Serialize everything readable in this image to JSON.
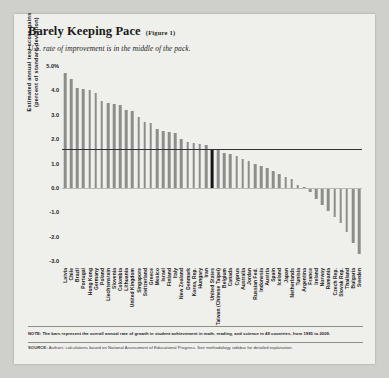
{
  "header": {
    "title": "Barely Keeping Pace",
    "figure_label": "(Figure 1)",
    "subtitle": "U.S. rate of improvement is in the middle of the pack."
  },
  "footer": {
    "note_lead": "NOTE:",
    "note_text": "The bars represent the overall annual rate of growth in student achievement in math, reading, and science in 49 countries, from 1995 to 2009.",
    "source_lead": "SOURCE:",
    "source_text": "Authors' calculations based on National Assessment of Educational Progress. See methodology sidebar for detailed explanation."
  },
  "colors": {
    "bar": "#8d8d8a",
    "highlight_bar": "#161616",
    "reference_line": "#333333",
    "page_background": "#efefec"
  },
  "chart_data": {
    "type": "bar",
    "title": "Barely Keeping Pace",
    "subtitle": "U.S. rate of improvement is in the middle of the pack.",
    "xlabel": "",
    "ylabel": "Estimated annual test-score gains (percent of standard deviation)",
    "ylim": [
      -3.0,
      5.0
    ],
    "yticks": [
      "5.0%",
      "4.0",
      "3.0",
      "2.0",
      "1.0",
      "0.0",
      "-1.0",
      "-2.0",
      "-3.0"
    ],
    "ytick_values": [
      5.0,
      4.0,
      3.0,
      2.0,
      1.0,
      0.0,
      -1.0,
      -2.0,
      -3.0
    ],
    "grid": false,
    "legend": "none",
    "highlight_category": "United States",
    "reference_line": {
      "value": 1.6,
      "label": ""
    },
    "categories": [
      "Latvia",
      "Chile",
      "Brazil",
      "Portugal",
      "Hong Kong",
      "Germany",
      "Poland",
      "Liechtenstein",
      "Slovenia",
      "Colombia",
      "Lithuania",
      "United Kingdom",
      "Singapore",
      "Switzerland",
      "Greece",
      "Mexico",
      "Israel",
      "Finland",
      "Italy",
      "New Zealand",
      "Denmark",
      "Korea, Rep.",
      "Hungary",
      "Iran",
      "United States",
      "Taiwan (Chinese Taipei)",
      "Belgium",
      "Canada",
      "Cyprus",
      "Australia",
      "Jordan",
      "Russian Fed.",
      "Indonesia",
      "Austria",
      "Spain",
      "Iceland",
      "Japan",
      "Netherlands",
      "Tunisia",
      "Argentina",
      "France",
      "Ireland",
      "Norway",
      "Romania",
      "Czech Rep.",
      "Slovak Rep.",
      "Thailand",
      "Bulgaria",
      "Sweden"
    ],
    "values": [
      4.7,
      4.45,
      4.1,
      4.05,
      4.0,
      3.9,
      3.55,
      3.5,
      3.45,
      3.4,
      3.2,
      3.15,
      2.9,
      2.7,
      2.65,
      2.4,
      2.35,
      2.3,
      2.25,
      2.0,
      1.9,
      1.85,
      1.8,
      1.75,
      1.6,
      1.55,
      1.45,
      1.4,
      1.3,
      1.2,
      1.1,
      1.0,
      0.9,
      0.8,
      0.7,
      0.55,
      0.45,
      0.35,
      0.1,
      0.05,
      -0.15,
      -0.45,
      -0.7,
      -0.95,
      -1.2,
      -1.45,
      -1.8,
      -2.25,
      -2.7
    ]
  }
}
